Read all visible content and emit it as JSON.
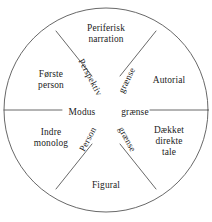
{
  "diagram": {
    "shape": "circle",
    "stroke_color": "#4a4a4a",
    "background_color": "#ffffff",
    "text_color": "#1c1c1c",
    "sectors": [
      {
        "id": "top",
        "label": "Periferisk\nnarration",
        "position": "top"
      },
      {
        "id": "upper-right",
        "label": "Autorial",
        "position": "upper-right"
      },
      {
        "id": "lower-right",
        "label": "Dækket\ndirekte\ntale",
        "position": "lower-right"
      },
      {
        "id": "bottom",
        "label": "Figural",
        "position": "bottom"
      },
      {
        "id": "lower-left",
        "label": "Indre\nmonolog",
        "position": "lower-left"
      },
      {
        "id": "upper-left",
        "label": "Første\nperson",
        "position": "upper-left"
      }
    ],
    "axes": [
      {
        "id": "modus",
        "label": "Modus",
        "orientation": "horizontal",
        "side": "left"
      },
      {
        "id": "graense-center",
        "label": "grænse",
        "orientation": "horizontal",
        "side": "right"
      },
      {
        "id": "perspektiv",
        "label": "Perspektiv",
        "orientation": "diagonal",
        "side": "upper-left",
        "rotation_deg": 62
      },
      {
        "id": "graense-upper",
        "label": "grænse",
        "orientation": "diagonal",
        "side": "upper-right",
        "rotation_deg": -64
      },
      {
        "id": "person",
        "label": "Person",
        "orientation": "diagonal",
        "side": "lower-left",
        "rotation_deg": -62
      },
      {
        "id": "graense-lower",
        "label": "grænse",
        "orientation": "diagonal",
        "side": "lower-right",
        "rotation_deg": 62
      }
    ]
  }
}
